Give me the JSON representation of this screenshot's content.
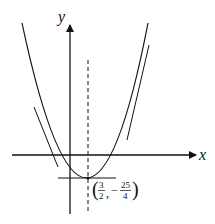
{
  "diagram": {
    "type": "parabola-graph",
    "axes": {
      "x_label": "x",
      "y_label": "y"
    },
    "vertex": {
      "label_x_num": "3",
      "label_x_den": "2",
      "label_y_sign": "−",
      "label_y_num": "25",
      "label_y_den": "4",
      "open_paren": "(",
      "comma": ",",
      "close_paren": ")"
    },
    "features": [
      "axis of symmetry (dashed)",
      "horizontal tangent at vertex",
      "tangent line left branch",
      "tangent line right branch"
    ],
    "colors": {
      "stroke": "#111111",
      "background": "#ffffff"
    }
  }
}
